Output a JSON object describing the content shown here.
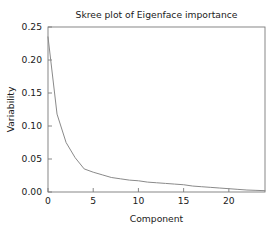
{
  "chart_data": {
    "type": "line",
    "title": "Skree plot of Eigenface importance",
    "xlabel": "Component",
    "ylabel": "Variability",
    "xlim": [
      0,
      24
    ],
    "ylim": [
      0.0,
      0.25
    ],
    "grid": false,
    "legend": null,
    "xticks": [
      0,
      5,
      10,
      15,
      20
    ],
    "xtick_labels": [
      "0",
      "5",
      "10",
      "15",
      "20"
    ],
    "yticks": [
      0.0,
      0.05,
      0.1,
      0.15,
      0.2,
      0.25
    ],
    "ytick_labels": [
      "0.00",
      "0.05",
      "0.10",
      "0.15",
      "0.20",
      "0.25"
    ],
    "series": [
      {
        "name": "Variability",
        "color": "#8a8a8a",
        "x": [
          0,
          1,
          2,
          3,
          4,
          5,
          6,
          7,
          8,
          9,
          10,
          11,
          12,
          13,
          14,
          15,
          16,
          17,
          18,
          19,
          20,
          21,
          22,
          23,
          24
        ],
        "values": [
          0.235,
          0.118,
          0.075,
          0.052,
          0.035,
          0.03,
          0.026,
          0.022,
          0.02,
          0.018,
          0.017,
          0.015,
          0.014,
          0.013,
          0.012,
          0.011,
          0.009,
          0.008,
          0.007,
          0.006,
          0.005,
          0.004,
          0.003,
          0.0025,
          0.002
        ]
      }
    ]
  },
  "figure": {
    "background_color": "#ffffff",
    "frame_color": "#7a7a7a",
    "text_color": "#1a1a1a"
  }
}
